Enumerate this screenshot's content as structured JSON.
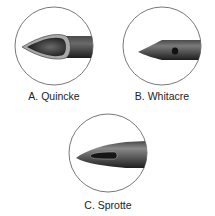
{
  "figure": {
    "panels": [
      {
        "id": "A",
        "label": "A. Quincke",
        "tip_type": "cutting-bevel"
      },
      {
        "id": "B",
        "label": "B. Whitacre",
        "tip_type": "pencil-point-side-hole"
      },
      {
        "id": "C",
        "label": "C. Sprotte",
        "tip_type": "pencil-point-long-side-slot"
      }
    ],
    "colors": {
      "circle_stroke": "#555555",
      "needle_dark": "#2a2a2a",
      "needle_mid": "#5a5a5a",
      "bevel_light": "#9a9a9a",
      "background": "#ffffff"
    }
  }
}
